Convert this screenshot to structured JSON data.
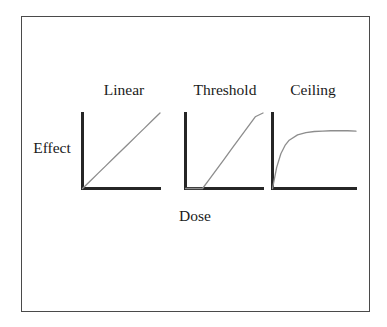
{
  "figure": {
    "axis_y_label": "Effect",
    "axis_x_label": "Dose",
    "frame_color": "#4a4a4a",
    "axis_color": "#262626",
    "curve_color": "#8d8d8d",
    "background_color": "#ffffff"
  },
  "panels": [
    {
      "id": "linear",
      "title": "Linear"
    },
    {
      "id": "threshold",
      "title": "Threshold"
    },
    {
      "id": "ceiling",
      "title": "Ceiling"
    }
  ],
  "chart_data": [
    {
      "type": "line",
      "title": "Linear",
      "xlabel": "Dose",
      "ylabel": "Effect",
      "xlim": [
        0,
        1
      ],
      "ylim": [
        0,
        1
      ],
      "grid": false,
      "legend": "none",
      "axis_ticks": [],
      "series": [
        {
          "name": "Linear dose-response",
          "x": [
            0.0,
            0.1,
            0.2,
            0.3,
            0.4,
            0.5,
            0.6,
            0.7,
            0.8,
            0.9,
            1.0
          ],
          "values": [
            0.0,
            0.1,
            0.2,
            0.3,
            0.4,
            0.5,
            0.6,
            0.7,
            0.8,
            0.9,
            1.0
          ]
        }
      ],
      "annotation": "Effect increases in direct proportion to dose starting from the origin."
    },
    {
      "type": "line",
      "title": "Threshold",
      "xlabel": "Dose",
      "ylabel": "Effect",
      "xlim": [
        0,
        1
      ],
      "ylim": [
        0,
        1
      ],
      "grid": false,
      "legend": "none",
      "axis_ticks": [],
      "series": [
        {
          "name": "Threshold dose-response",
          "x": [
            0.0,
            0.1,
            0.2,
            0.22,
            0.3,
            0.4,
            0.5,
            0.6,
            0.7,
            0.8,
            0.9,
            1.0
          ],
          "values": [
            0.0,
            0.0,
            0.0,
            0.0,
            0.11,
            0.25,
            0.39,
            0.53,
            0.67,
            0.81,
            0.95,
            1.0
          ]
        }
      ],
      "annotation": "No effect until a threshold dose is exceeded, then a linear rise."
    },
    {
      "type": "line",
      "title": "Ceiling",
      "xlabel": "Dose",
      "ylabel": "Effect",
      "xlim": [
        0,
        1
      ],
      "ylim": [
        0,
        1
      ],
      "grid": false,
      "legend": "none",
      "axis_ticks": [],
      "series": [
        {
          "name": "Ceiling dose-response",
          "x": [
            0.0,
            0.05,
            0.1,
            0.15,
            0.2,
            0.3,
            0.4,
            0.5,
            0.6,
            0.7,
            0.8,
            0.9,
            1.0
          ],
          "values": [
            0.0,
            0.28,
            0.46,
            0.57,
            0.64,
            0.71,
            0.74,
            0.755,
            0.76,
            0.765,
            0.765,
            0.765,
            0.76
          ]
        }
      ],
      "annotation": "Effect rises steeply then plateaus at a maximal ceiling value."
    }
  ]
}
